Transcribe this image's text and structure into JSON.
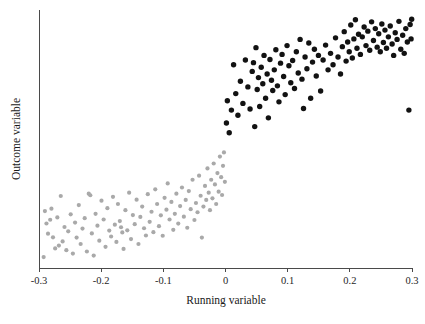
{
  "figure": {
    "width": 425,
    "height": 324,
    "background": "#ffffff"
  },
  "axes": {
    "x_label": "Running variable",
    "y_label": "Outcome variable",
    "x_ticks": [
      "-0.3",
      "-0.2",
      "-0.1",
      "0",
      "0.1",
      "0.2",
      "0.3"
    ],
    "y_ticks": [],
    "axis_color": "#4a4a4a",
    "plot_left": 39,
    "plot_right": 412,
    "plot_top": 10,
    "plot_bottom": 268
  },
  "style": {
    "control_color": "#a9a9a9",
    "treatment_color": "#121212",
    "control_radius": 2.1,
    "treatment_radius": 2.7
  },
  "chart_data": {
    "type": "scatter",
    "title": "",
    "xlabel": "Running variable",
    "ylabel": "Outcome variable",
    "xlim": [
      -0.3,
      0.3
    ],
    "ylim": [
      0,
      1
    ],
    "xticks": [
      -0.3,
      -0.2,
      -0.1,
      0,
      0.1,
      0.2,
      0.3
    ],
    "yticks": [],
    "grid": false,
    "legend": false,
    "cutoff": 0,
    "annotation": "Regression discontinuity design: outcome jumps discontinuously at running variable = 0; control group (running variable < 0) drawn in gray, treatment group (running variable >= 0) drawn in black.",
    "series": [
      {
        "name": "Control (below cutoff)",
        "color": "#a9a9a9",
        "marker": "circle",
        "points": [
          [
            -0.2925,
            0.0425
          ],
          [
            -0.2905,
            0.2205
          ],
          [
            -0.288,
            0.1725
          ],
          [
            -0.2855,
            0.133
          ],
          [
            -0.282,
            0.187
          ],
          [
            -0.28,
            0.23
          ],
          [
            -0.2775,
            0.119
          ],
          [
            -0.274,
            0.076
          ],
          [
            -0.2705,
            0.196
          ],
          [
            -0.268,
            0.087
          ],
          [
            -0.265,
            0.279
          ],
          [
            -0.262,
            0.103
          ],
          [
            -0.259,
            0.159
          ],
          [
            -0.256,
            0.069
          ],
          [
            -0.253,
            0.142
          ],
          [
            -0.249,
            0.208
          ],
          [
            -0.2455,
            0.056
          ],
          [
            -0.242,
            0.176
          ],
          [
            -0.2395,
            0.118
          ],
          [
            -0.236,
            0.244
          ],
          [
            -0.233,
            0.093
          ],
          [
            -0.23,
            0.153
          ],
          [
            -0.2265,
            0.193
          ],
          [
            -0.223,
            0.064
          ],
          [
            -0.22,
            0.288
          ],
          [
            -0.2175,
            0.282
          ],
          [
            -0.215,
            0.134
          ],
          [
            -0.212,
            0.048
          ],
          [
            -0.209,
            0.21
          ],
          [
            -0.206,
            0.164
          ],
          [
            -0.203,
            0.106
          ],
          [
            -0.1995,
            0.261
          ],
          [
            -0.196,
            0.188
          ],
          [
            -0.193,
            0.082
          ],
          [
            -0.19,
            0.232
          ],
          [
            -0.187,
            0.145
          ],
          [
            -0.184,
            0.122
          ],
          [
            -0.181,
            0.276
          ],
          [
            -0.178,
            0.168
          ],
          [
            -0.1755,
            0.101
          ],
          [
            -0.173,
            0.248
          ],
          [
            -0.17,
            0.182
          ],
          [
            -0.168,
            0.158
          ],
          [
            -0.166,
            0.138
          ],
          [
            -0.164,
            0.074
          ],
          [
            -0.161,
            0.224
          ],
          [
            -0.158,
            0.146
          ],
          [
            -0.155,
            0.292
          ],
          [
            -0.152,
            0.112
          ],
          [
            -0.149,
            0.205
          ],
          [
            -0.146,
            0.17
          ],
          [
            -0.143,
            0.265
          ],
          [
            -0.14,
            0.093
          ],
          [
            -0.137,
            0.198
          ],
          [
            -0.134,
            0.238
          ],
          [
            -0.131,
            0.154
          ],
          [
            -0.128,
            0.126
          ],
          [
            -0.125,
            0.286
          ],
          [
            -0.122,
            0.179
          ],
          [
            -0.119,
            0.218
          ],
          [
            -0.116,
            0.139
          ],
          [
            -0.113,
            0.305
          ],
          [
            -0.11,
            0.248
          ],
          [
            -0.107,
            0.162
          ],
          [
            -0.104,
            0.204
          ],
          [
            -0.101,
            0.125
          ],
          [
            -0.098,
            0.272
          ],
          [
            -0.095,
            0.226
          ],
          [
            -0.093,
            0.328
          ],
          [
            -0.09,
            0.188
          ],
          [
            -0.087,
            0.256
          ],
          [
            -0.084,
            0.148
          ],
          [
            -0.0815,
            0.21
          ],
          [
            -0.079,
            0.288
          ],
          [
            -0.076,
            0.172
          ],
          [
            -0.073,
            0.24
          ],
          [
            -0.07,
            0.312
          ],
          [
            -0.067,
            0.199
          ],
          [
            -0.064,
            0.264
          ],
          [
            -0.0615,
            0.156
          ],
          [
            -0.059,
            0.298
          ],
          [
            -0.056,
            0.228
          ],
          [
            -0.053,
            0.342
          ],
          [
            -0.05,
            0.186
          ],
          [
            -0.0475,
            0.252
          ],
          [
            -0.045,
            0.216
          ],
          [
            -0.0425,
            0.358
          ],
          [
            -0.04,
            0.28
          ],
          [
            -0.038,
            0.118
          ],
          [
            -0.0355,
            0.238
          ],
          [
            -0.033,
            0.318
          ],
          [
            -0.031,
            0.264
          ],
          [
            -0.029,
            0.386
          ],
          [
            -0.027,
            0.292
          ],
          [
            -0.025,
            0.224
          ],
          [
            -0.023,
            0.342
          ],
          [
            -0.021,
            0.27
          ],
          [
            -0.019,
            0.405
          ],
          [
            -0.017,
            0.324
          ],
          [
            -0.015,
            0.248
          ],
          [
            -0.013,
            0.368
          ],
          [
            -0.011,
            0.296
          ],
          [
            -0.009,
            0.432
          ],
          [
            -0.007,
            0.352
          ],
          [
            -0.0055,
            0.283
          ],
          [
            -0.004,
            0.396
          ],
          [
            -0.0025,
            0.448
          ],
          [
            -0.001,
            0.334
          ]
        ]
      },
      {
        "name": "Treatment (at/above cutoff)",
        "color": "#121212",
        "marker": "circle",
        "points": [
          [
            0.0015,
            0.562
          ],
          [
            0.003,
            0.648
          ],
          [
            0.006,
            0.524
          ],
          [
            0.0095,
            0.612
          ],
          [
            0.013,
            0.788
          ],
          [
            0.0165,
            0.676
          ],
          [
            0.02,
            0.592
          ],
          [
            0.024,
            0.724
          ],
          [
            0.028,
            0.638
          ],
          [
            0.032,
            0.806
          ],
          [
            0.036,
            0.702
          ],
          [
            0.0395,
            0.616
          ],
          [
            0.043,
            0.762
          ],
          [
            0.045,
            0.796
          ],
          [
            0.047,
            0.548
          ],
          [
            0.049,
            0.854
          ],
          [
            0.051,
            0.692
          ],
          [
            0.053,
            0.738
          ],
          [
            0.055,
            0.626
          ],
          [
            0.0575,
            0.778
          ],
          [
            0.06,
            0.714
          ],
          [
            0.062,
            0.824
          ],
          [
            0.0645,
            0.658
          ],
          [
            0.067,
            0.752
          ],
          [
            0.069,
            0.582
          ],
          [
            0.0715,
            0.808
          ],
          [
            0.074,
            0.728
          ],
          [
            0.076,
            0.688
          ],
          [
            0.0785,
            0.768
          ],
          [
            0.081,
            0.846
          ],
          [
            0.0835,
            0.706
          ],
          [
            0.086,
            0.644
          ],
          [
            0.0885,
            0.794
          ],
          [
            0.091,
            0.828
          ],
          [
            0.0935,
            0.742
          ],
          [
            0.096,
            0.672
          ],
          [
            0.099,
            0.862
          ],
          [
            0.102,
            0.784
          ],
          [
            0.105,
            0.718
          ],
          [
            0.108,
            0.804
          ],
          [
            0.111,
            0.696
          ],
          [
            0.114,
            0.838
          ],
          [
            0.117,
            0.756
          ],
          [
            0.12,
            0.886
          ],
          [
            0.123,
            0.732
          ],
          [
            0.1255,
            0.618
          ],
          [
            0.128,
            0.818
          ],
          [
            0.131,
            0.772
          ],
          [
            0.134,
            0.872
          ],
          [
            0.137,
            0.658
          ],
          [
            0.14,
            0.798
          ],
          [
            0.143,
            0.848
          ],
          [
            0.146,
            0.744
          ],
          [
            0.1495,
            0.824
          ],
          [
            0.153,
            0.686
          ],
          [
            0.157,
            0.806
          ],
          [
            0.161,
            0.864
          ],
          [
            0.165,
            0.768
          ],
          [
            0.169,
            0.832
          ],
          [
            0.173,
            0.788
          ],
          [
            0.177,
            0.892
          ],
          [
            0.181,
            0.818
          ],
          [
            0.185,
            0.752
          ],
          [
            0.188,
            0.858
          ],
          [
            0.191,
            0.916
          ],
          [
            0.194,
            0.802
          ],
          [
            0.1965,
            0.876
          ],
          [
            0.199,
            0.838
          ],
          [
            0.2015,
            0.942
          ],
          [
            0.204,
            0.814
          ],
          [
            0.2065,
            0.888
          ],
          [
            0.209,
            0.962
          ],
          [
            0.2115,
            0.852
          ],
          [
            0.214,
            0.906
          ],
          [
            0.217,
            0.828
          ],
          [
            0.22,
            0.896
          ],
          [
            0.223,
            0.934
          ],
          [
            0.226,
            0.862
          ],
          [
            0.229,
            0.918
          ],
          [
            0.232,
            0.844
          ],
          [
            0.235,
            0.954
          ],
          [
            0.238,
            0.882
          ],
          [
            0.241,
            0.928
          ],
          [
            0.244,
            0.856
          ],
          [
            0.2465,
            0.908
          ],
          [
            0.249,
            0.838
          ],
          [
            0.2515,
            0.946
          ],
          [
            0.254,
            0.874
          ],
          [
            0.2565,
            0.922
          ],
          [
            0.259,
            0.852
          ],
          [
            0.262,
            0.896
          ],
          [
            0.265,
            0.938
          ],
          [
            0.268,
            0.868
          ],
          [
            0.2705,
            0.824
          ],
          [
            0.273,
            0.912
          ],
          [
            0.276,
            0.886
          ],
          [
            0.279,
            0.956
          ],
          [
            0.282,
            0.848
          ],
          [
            0.285,
            0.902
          ],
          [
            0.2875,
            0.832
          ],
          [
            0.29,
            0.928
          ],
          [
            0.2925,
            0.876
          ],
          [
            0.295,
            0.612
          ],
          [
            0.297,
            0.944
          ],
          [
            0.2985,
            0.888
          ],
          [
            0.2995,
            0.964
          ]
        ]
      }
    ]
  }
}
